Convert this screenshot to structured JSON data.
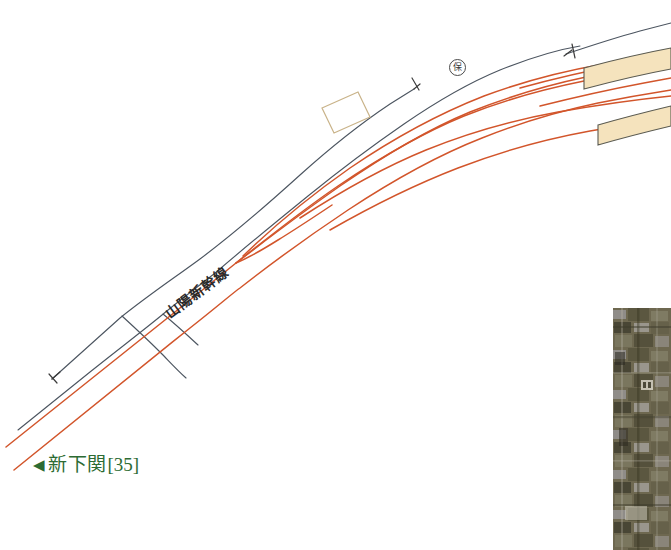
{
  "diagram": {
    "kind": "railway-track-layout-diagram",
    "background_color": "#ffffff",
    "line_name_label": "山陽新幹線",
    "station_label": {
      "arrow": "◀",
      "name": "新下関",
      "number": "[35]",
      "color": "#2d6b33"
    },
    "siding_marker": {
      "glyph": "保",
      "title": "circled-maintenance-marker"
    },
    "colors": {
      "track_red": "#d2552b",
      "track_dark": "#4c5560",
      "platform_fill": "#f5e3bd",
      "platform_stroke": "#5a5a50",
      "building_stroke": "#c9b389",
      "label_green": "#2d6b33",
      "photo_base": "#6d6752"
    },
    "elements": {
      "main_tracks_count": 4,
      "siding_tracks_count": 3,
      "platform_count": 2,
      "buffer_stop_count": 3,
      "building_outline_count": 1
    },
    "aerial_photo": {
      "label": "aerial-photograph-inset",
      "x": 613,
      "y": 308,
      "width": 58,
      "height": 242
    }
  }
}
